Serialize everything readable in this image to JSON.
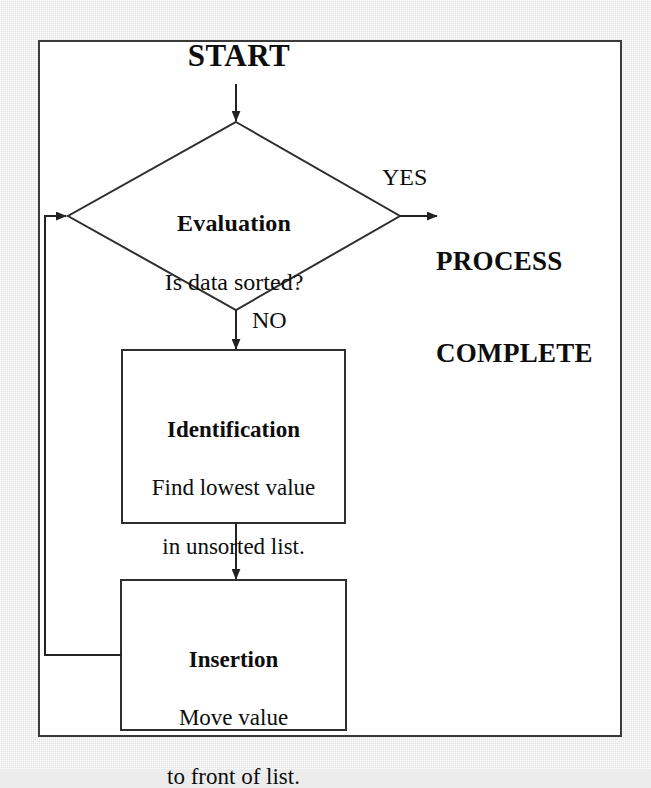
{
  "diagram": {
    "type": "flowchart",
    "title_text": "START",
    "terminal": {
      "line1": "PROCESS",
      "line2": "COMPLETE"
    },
    "decision": {
      "title": "Evaluation",
      "question": "Is data sorted?"
    },
    "branch_labels": {
      "yes": "YES",
      "no": "NO"
    },
    "steps": [
      {
        "title": "Identification",
        "line1": "Find lowest value",
        "line2": "in unsorted list."
      },
      {
        "title": "Insertion",
        "line1": "Move value",
        "line2": "to front of list."
      }
    ],
    "colors": {
      "ink": "#0d0d0d",
      "stroke": "#2e2e2e",
      "frame": "#3a3a3a",
      "paper": "#ffffff",
      "background": "#ebebeb"
    }
  }
}
